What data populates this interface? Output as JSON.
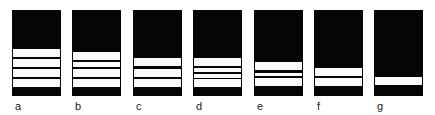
{
  "figure": {
    "panels": [
      {
        "label": "a",
        "x": 12,
        "stripes": [
          [
            39,
            8
          ],
          [
            49,
            8
          ],
          [
            59,
            8
          ],
          [
            69,
            8
          ]
        ]
      },
      {
        "label": "b",
        "x": 72,
        "stripes": [
          [
            42,
            8
          ],
          [
            52,
            5
          ],
          [
            59,
            8
          ],
          [
            69,
            8
          ]
        ]
      },
      {
        "label": "c",
        "x": 133,
        "stripes": [
          [
            48,
            8
          ],
          [
            59,
            8
          ],
          [
            69,
            8
          ]
        ]
      },
      {
        "label": "d",
        "x": 193,
        "stripes": [
          [
            48,
            8
          ],
          [
            58,
            4
          ],
          [
            64,
            4
          ],
          [
            69,
            8
          ]
        ]
      },
      {
        "label": "e",
        "x": 254,
        "stripes": [
          [
            52,
            8
          ],
          [
            63,
            3
          ],
          [
            68,
            8
          ]
        ]
      },
      {
        "label": "f",
        "x": 314,
        "stripes": [
          [
            58,
            8
          ],
          [
            68,
            8
          ]
        ]
      },
      {
        "label": "g",
        "x": 374,
        "stripes": [
          [
            67,
            8
          ]
        ]
      }
    ],
    "colors": {
      "panel": "#050505",
      "stripe": "#fafafa",
      "label": "#222222"
    }
  }
}
